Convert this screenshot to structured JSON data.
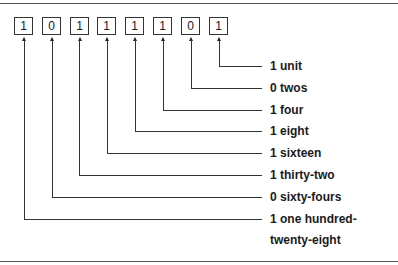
{
  "diagram": {
    "bits": [
      "1",
      "0",
      "1",
      "1",
      "1",
      "1",
      "0",
      "1"
    ],
    "labels": [
      {
        "text": "1 unit"
      },
      {
        "text": "0 twos"
      },
      {
        "text": "1 four"
      },
      {
        "text": "1 eight"
      },
      {
        "text": "1 sixteen"
      },
      {
        "text": "1 thirty-two"
      },
      {
        "text": "0 sixty-fours"
      },
      {
        "text": "1 one hundred-",
        "line2": "twenty-eight"
      }
    ],
    "line_color": "#333333"
  }
}
